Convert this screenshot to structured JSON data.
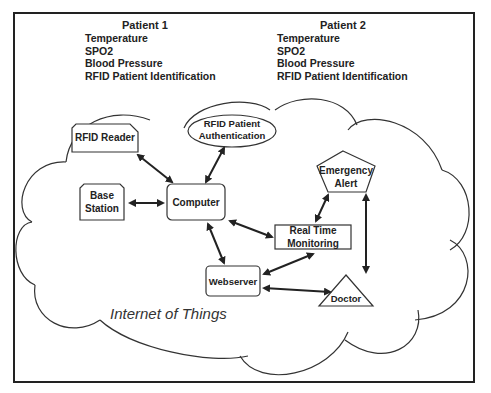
{
  "patients": [
    {
      "title": "Patient 1",
      "items": [
        "Temperature",
        "SPO2",
        "Blood Pressure",
        "RFID Patient Identification"
      ]
    },
    {
      "title": "Patient 2",
      "items": [
        "Temperature",
        "SPO2",
        "Blood Pressure",
        "RFID Patient Identification"
      ]
    }
  ],
  "nodes": {
    "rfid_reader": "RFID Reader",
    "rfid_auth_line1": "RFID Patient",
    "rfid_auth_line2": "Authentication",
    "base_station_line1": "Base",
    "base_station_line2": "Station",
    "computer": "Computer",
    "emergency_line1": "Emergency",
    "emergency_line2": "Alert",
    "rtm_line1": "Real Time",
    "rtm_line2": "Monitoring",
    "webserver": "Webserver",
    "doctor": "Doctor"
  },
  "cloud_label": "Internet of Things",
  "connections": [
    [
      "RFID Reader",
      "Computer"
    ],
    [
      "RFID Patient Authentication",
      "Computer"
    ],
    [
      "Base Station",
      "Computer"
    ],
    [
      "Computer",
      "Real Time Monitoring"
    ],
    [
      "Computer",
      "Webserver"
    ],
    [
      "Emergency Alert",
      "Real Time Monitoring"
    ],
    [
      "Emergency Alert",
      "Doctor"
    ],
    [
      "Webserver",
      "Real Time Monitoring"
    ],
    [
      "Webserver",
      "Doctor"
    ]
  ]
}
